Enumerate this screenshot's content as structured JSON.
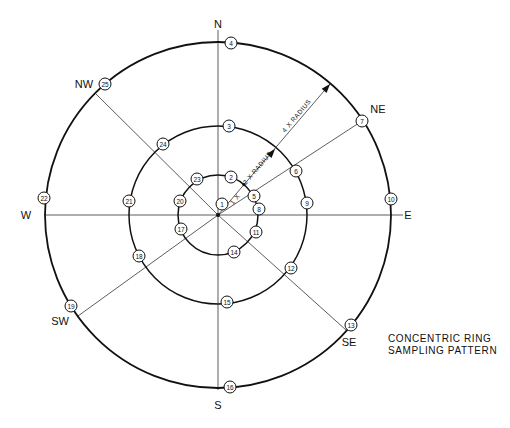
{
  "diagram": {
    "center": [
      218,
      215
    ],
    "rings": [
      {
        "name": "inner-ring",
        "radius": 40,
        "stroke_width": 1.5,
        "label": "1 X"
      },
      {
        "name": "middle-ring",
        "radius": 89,
        "stroke_width": 1.5,
        "label": "2 X RADIUS"
      },
      {
        "name": "outer-ring",
        "radius": 173,
        "stroke_width": 1.8,
        "label": "4 X RADIUS"
      }
    ],
    "axes": [
      {
        "name": "axis-n-s",
        "x1": 218,
        "y1": 30,
        "x2": 218,
        "y2": 390
      },
      {
        "name": "axis-w-e",
        "x1": 44,
        "y1": 215,
        "x2": 403,
        "y2": 215
      },
      {
        "name": "axis-ne",
        "x1": 218,
        "y1": 215,
        "x2": 362,
        "y2": 121
      },
      {
        "name": "axis-nw",
        "x1": 218,
        "y1": 215,
        "x2": 96,
        "y2": 94
      },
      {
        "name": "axis-se",
        "x1": 218,
        "y1": 215,
        "x2": 346,
        "y2": 330
      },
      {
        "name": "axis-sw",
        "x1": 218,
        "y1": 215,
        "x2": 78,
        "y2": 316
      }
    ],
    "radius_arrow": {
      "x1": 218,
      "y1": 215,
      "x2": 330,
      "y2": 84,
      "arrow_mid": [
        275,
        149
      ],
      "arrow_outer": [
        330,
        84
      ]
    },
    "radius_labels": [
      {
        "text": "1 X",
        "x": 233,
        "y": 205,
        "rotate": -50
      },
      {
        "text": "2 X RADIUS",
        "x": 246,
        "y": 185,
        "rotate": -50
      },
      {
        "text": "4 X RADIUS",
        "x": 285,
        "y": 133,
        "rotate": -50
      }
    ],
    "directions": [
      {
        "text": "N",
        "x": 218,
        "y": 24
      },
      {
        "text": "S",
        "x": 218,
        "y": 405
      },
      {
        "text": "W",
        "x": 26,
        "y": 215
      },
      {
        "text": "E",
        "x": 408,
        "y": 215
      },
      {
        "text": "NE",
        "x": 378,
        "y": 109
      },
      {
        "text": "NW",
        "x": 84,
        "y": 84
      },
      {
        "text": "SE",
        "x": 349,
        "y": 342
      },
      {
        "text": "SW",
        "x": 60,
        "y": 321
      }
    ],
    "sample_points": [
      {
        "id": "1",
        "x": 222,
        "y": 204
      },
      {
        "id": "2",
        "x": 231,
        "y": 177
      },
      {
        "id": "3",
        "x": 229,
        "y": 126
      },
      {
        "id": "4",
        "x": 231,
        "y": 43
      },
      {
        "id": "5",
        "x": 254,
        "y": 196
      },
      {
        "id": "6",
        "x": 296,
        "y": 171
      },
      {
        "id": "7",
        "x": 362,
        "y": 121
      },
      {
        "id": "8",
        "x": 259,
        "y": 209
      },
      {
        "id": "9",
        "x": 307,
        "y": 203
      },
      {
        "id": "10",
        "x": 391,
        "y": 199
      },
      {
        "id": "11",
        "x": 256,
        "y": 232
      },
      {
        "id": "12",
        "x": 291,
        "y": 268
      },
      {
        "id": "13",
        "x": 351,
        "y": 325
      },
      {
        "id": "14",
        "x": 234,
        "y": 252
      },
      {
        "id": "15",
        "x": 227,
        "y": 302
      },
      {
        "id": "16",
        "x": 230,
        "y": 387
      },
      {
        "id": "17",
        "x": 181,
        "y": 229
      },
      {
        "id": "18",
        "x": 139,
        "y": 256
      },
      {
        "id": "19",
        "x": 71,
        "y": 306
      },
      {
        "id": "20",
        "x": 180,
        "y": 201
      },
      {
        "id": "21",
        "x": 129,
        "y": 201
      },
      {
        "id": "22",
        "x": 44,
        "y": 198
      },
      {
        "id": "23",
        "x": 197,
        "y": 179
      },
      {
        "id": "24",
        "x": 163,
        "y": 144
      },
      {
        "id": "25",
        "x": 105,
        "y": 84
      }
    ]
  },
  "caption": {
    "line1": "CONCENTRIC RING",
    "line2": "SAMPLING PATTERN"
  }
}
